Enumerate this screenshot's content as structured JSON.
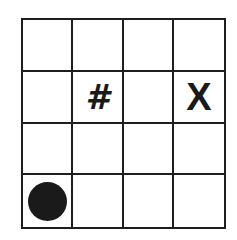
{
  "grid": {
    "rows": 4,
    "cols": 4,
    "line_color": "#1e1e1e",
    "cells": [
      [
        {
          "symbol": ""
        },
        {
          "symbol": ""
        },
        {
          "symbol": ""
        },
        {
          "symbol": ""
        }
      ],
      [
        {
          "symbol": ""
        },
        {
          "symbol": "#",
          "type": "hash"
        },
        {
          "symbol": ""
        },
        {
          "symbol": "X",
          "type": "x"
        }
      ],
      [
        {
          "symbol": ""
        },
        {
          "symbol": ""
        },
        {
          "symbol": ""
        },
        {
          "symbol": ""
        }
      ],
      [
        {
          "symbol": "",
          "type": "disc"
        },
        {
          "symbol": ""
        },
        {
          "symbol": ""
        },
        {
          "symbol": ""
        }
      ]
    ]
  },
  "markers": {
    "hash": {
      "label": "#",
      "row": 2,
      "col": 2
    },
    "x": {
      "label": "X",
      "row": 2,
      "col": 4
    },
    "disc": {
      "label": "filled-circle",
      "row": 4,
      "col": 1,
      "color": "#1a1a1a"
    }
  }
}
